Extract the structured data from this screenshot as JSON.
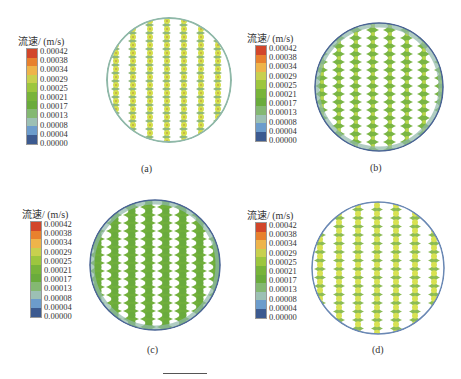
{
  "figure": {
    "legend": {
      "title": "流速/ (m/s)",
      "values": [
        "0.00042",
        "0.00038",
        "0.00034",
        "0.00029",
        "0.00025",
        "0.00021",
        "0.00017",
        "0.00013",
        "0.00008",
        "0.00004",
        "0.00000"
      ],
      "colors": [
        "#d2462a",
        "#e8812e",
        "#eeb44a",
        "#c8d04e",
        "#9dc63e",
        "#78b43a",
        "#6aab3c",
        "#84b872",
        "#9cc0b4",
        "#6c9ccc",
        "#3c5a90"
      ]
    },
    "panels": [
      {
        "id": "a",
        "caption": "(a)",
        "description": "Velocity contour in circular cross-section; sparse wavy channels with bright yellow-green nodes"
      },
      {
        "id": "b",
        "caption": "(b)",
        "description": "Velocity contour; dense green wavy channels with blue rim"
      },
      {
        "id": "c",
        "caption": "(c)",
        "description": "Velocity contour; wide green wavy channels, narrow white gaps"
      },
      {
        "id": "d",
        "caption": "(d)",
        "description": "Velocity contour; green channels with bright yellow nodes, teal edges"
      }
    ],
    "colors": {
      "channel_green": "#7ab544",
      "node_yellow": "#d6e04a",
      "edge_teal": "#8fb8a8",
      "rim_blue": "#5a78a8",
      "gap_white": "#ffffff"
    }
  }
}
